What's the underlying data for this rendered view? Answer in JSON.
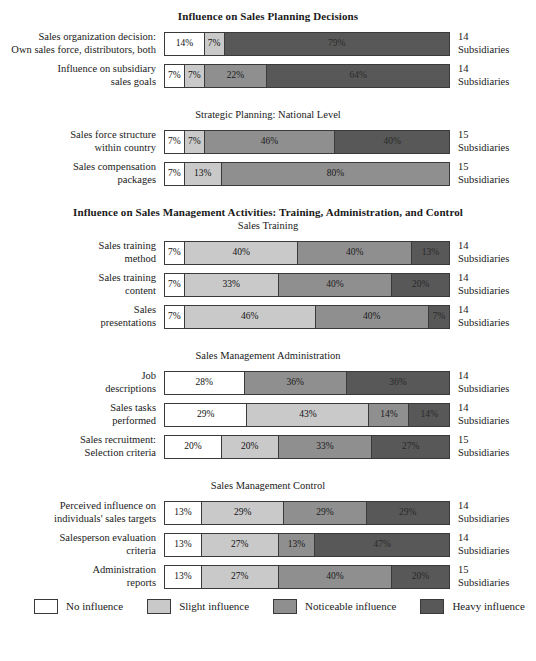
{
  "chart_data": {
    "type": "bar",
    "subtype": "stacked-horizontal-percentage",
    "title": "Influence on Sales Planning Decisions",
    "xlabel": "",
    "ylabel": "",
    "xlim": [
      0,
      100
    ],
    "grid": false,
    "legend_position": "bottom",
    "legend": [
      {
        "key": "lvl0",
        "label": "No influence",
        "color": "#ffffff"
      },
      {
        "key": "lvl1",
        "label": "Slight influence",
        "color": "#c9c9c9"
      },
      {
        "key": "lvl2",
        "label": "Noticeable influence",
        "color": "#8f8f8f"
      },
      {
        "key": "lvl3",
        "label": "Heavy influence",
        "color": "#585858"
      }
    ],
    "series": [
      {
        "name": "No influence",
        "values": [
          14,
          7,
          7,
          7,
          7,
          7,
          7,
          28,
          29,
          20,
          13,
          13,
          13
        ]
      },
      {
        "name": "Slight influence",
        "values": [
          7,
          7,
          7,
          13,
          40,
          33,
          46,
          0,
          43,
          20,
          29,
          27,
          27
        ]
      },
      {
        "name": "Noticeable influence",
        "values": [
          0,
          22,
          46,
          80,
          40,
          40,
          40,
          36,
          14,
          33,
          29,
          13,
          40
        ]
      },
      {
        "name": "Heavy influence",
        "values": [
          79,
          64,
          40,
          0,
          13,
          20,
          7,
          36,
          14,
          27,
          29,
          47,
          20
        ]
      }
    ],
    "categories": [
      "Sales organization decision: Own sales force, distributors, both",
      "Influence on subsidiary sales goals",
      "Sales force structure within country",
      "Sales compensation packages",
      "Sales training method",
      "Sales training content",
      "Sales presentations",
      "Job descriptions",
      "Sales tasks performed",
      "Sales recruitment: Selection criteria",
      "Perceived influence on individuals' sales targets",
      "Salesperson evaluation criteria",
      "Administration reports"
    ]
  },
  "sections": [
    {
      "title": "Influence on Sales Planning Decisions",
      "title_style": "bold",
      "subtitle": "",
      "rows": [
        {
          "label_lines": [
            "Sales organization decision:",
            "Own sales force, distributors, both"
          ],
          "segments": [
            {
              "level": "lvl0",
              "value": 14,
              "text": "14%"
            },
            {
              "level": "lvl1",
              "value": 7,
              "text": "7%"
            },
            {
              "level": "lvl3",
              "value": 79,
              "text": "79%"
            }
          ],
          "note_number": "14",
          "note_word": "Subsidiaries"
        },
        {
          "label_lines": [
            "Influence on subsidiary",
            "sales goals"
          ],
          "segments": [
            {
              "level": "lvl0",
              "value": 7,
              "text": "7%"
            },
            {
              "level": "lvl1",
              "value": 7,
              "text": "7%"
            },
            {
              "level": "lvl2",
              "value": 22,
              "text": "22%"
            },
            {
              "level": "lvl3",
              "value": 64,
              "text": "64%"
            }
          ],
          "note_number": "14",
          "note_word": "Subsidiaries"
        }
      ]
    },
    {
      "title": "",
      "title_style": "plain",
      "subtitle": "Strategic Planning: National Level",
      "rows": [
        {
          "label_lines": [
            "Sales force structure",
            "within country"
          ],
          "segments": [
            {
              "level": "lvl0",
              "value": 7,
              "text": "7%"
            },
            {
              "level": "lvl1",
              "value": 7,
              "text": "7%"
            },
            {
              "level": "lvl2",
              "value": 46,
              "text": "46%"
            },
            {
              "level": "lvl3",
              "value": 40,
              "text": "40%"
            }
          ],
          "note_number": "15",
          "note_word": "Subsidiaries"
        },
        {
          "label_lines": [
            "Sales compensation",
            "packages"
          ],
          "segments": [
            {
              "level": "lvl0",
              "value": 7,
              "text": "7%"
            },
            {
              "level": "lvl1",
              "value": 13,
              "text": "13%"
            },
            {
              "level": "lvl2",
              "value": 80,
              "text": "80%"
            }
          ],
          "note_number": "15",
          "note_word": "Subsidiaries"
        }
      ]
    },
    {
      "title": "Influence on Sales Management Activities: Training, Administration, and Control",
      "title_style": "bold",
      "subtitle": "Sales Training",
      "rows": [
        {
          "label_lines": [
            "Sales training",
            "method"
          ],
          "segments": [
            {
              "level": "lvl0",
              "value": 7,
              "text": "7%"
            },
            {
              "level": "lvl1",
              "value": 40,
              "text": "40%"
            },
            {
              "level": "lvl2",
              "value": 40,
              "text": "40%"
            },
            {
              "level": "lvl3",
              "value": 13,
              "text": "13%"
            }
          ],
          "note_number": "14",
          "note_word": "Subsidiaries"
        },
        {
          "label_lines": [
            "Sales training",
            "content"
          ],
          "segments": [
            {
              "level": "lvl0",
              "value": 7,
              "text": "7%"
            },
            {
              "level": "lvl1",
              "value": 33,
              "text": "33%"
            },
            {
              "level": "lvl2",
              "value": 40,
              "text": "40%"
            },
            {
              "level": "lvl3",
              "value": 20,
              "text": "20%"
            }
          ],
          "note_number": "14",
          "note_word": "Subsidiaries"
        },
        {
          "label_lines": [
            "Sales",
            "presentations"
          ],
          "segments": [
            {
              "level": "lvl0",
              "value": 7,
              "text": "7%"
            },
            {
              "level": "lvl1",
              "value": 46,
              "text": "46%"
            },
            {
              "level": "lvl2",
              "value": 40,
              "text": "40%"
            },
            {
              "level": "lvl3",
              "value": 7,
              "text": "7%"
            }
          ],
          "note_number": "14",
          "note_word": "Subsidiaries"
        }
      ]
    },
    {
      "title": "",
      "title_style": "plain",
      "subtitle": "Sales Management Administration",
      "rows": [
        {
          "label_lines": [
            "Job",
            "descriptions"
          ],
          "segments": [
            {
              "level": "lvl0",
              "value": 28,
              "text": "28%"
            },
            {
              "level": "lvl2",
              "value": 36,
              "text": "36%"
            },
            {
              "level": "lvl3",
              "value": 36,
              "text": "36%"
            }
          ],
          "note_number": "14",
          "note_word": "Subsidiaries"
        },
        {
          "label_lines": [
            "Sales tasks",
            "performed"
          ],
          "segments": [
            {
              "level": "lvl0",
              "value": 29,
              "text": "29%"
            },
            {
              "level": "lvl1",
              "value": 43,
              "text": "43%"
            },
            {
              "level": "lvl2",
              "value": 14,
              "text": "14%"
            },
            {
              "level": "lvl3",
              "value": 14,
              "text": "14%"
            }
          ],
          "note_number": "14",
          "note_word": "Subsidiaries"
        },
        {
          "label_lines": [
            "Sales recruitment:",
            "Selection criteria"
          ],
          "segments": [
            {
              "level": "lvl0",
              "value": 20,
              "text": "20%"
            },
            {
              "level": "lvl1",
              "value": 20,
              "text": "20%"
            },
            {
              "level": "lvl2",
              "value": 33,
              "text": "33%"
            },
            {
              "level": "lvl3",
              "value": 27,
              "text": "27%"
            }
          ],
          "note_number": "15",
          "note_word": "Subsidiaries"
        }
      ]
    },
    {
      "title": "",
      "title_style": "plain",
      "subtitle": "Sales Management Control",
      "rows": [
        {
          "label_lines": [
            "Perceived influence on",
            "individuals' sales targets"
          ],
          "segments": [
            {
              "level": "lvl0",
              "value": 13,
              "text": "13%"
            },
            {
              "level": "lvl1",
              "value": 29,
              "text": "29%"
            },
            {
              "level": "lvl2",
              "value": 29,
              "text": "29%"
            },
            {
              "level": "lvl3",
              "value": 29,
              "text": "29%"
            }
          ],
          "note_number": "14",
          "note_word": "Subsidiaries"
        },
        {
          "label_lines": [
            "Salesperson evaluation",
            "criteria"
          ],
          "segments": [
            {
              "level": "lvl0",
              "value": 13,
              "text": "13%"
            },
            {
              "level": "lvl1",
              "value": 27,
              "text": "27%"
            },
            {
              "level": "lvl2",
              "value": 13,
              "text": "13%"
            },
            {
              "level": "lvl3",
              "value": 47,
              "text": "47%"
            }
          ],
          "note_number": "14",
          "note_word": "Subsidiaries"
        },
        {
          "label_lines": [
            "Administration",
            "reports"
          ],
          "segments": [
            {
              "level": "lvl0",
              "value": 13,
              "text": "13%"
            },
            {
              "level": "lvl1",
              "value": 27,
              "text": "27%"
            },
            {
              "level": "lvl2",
              "value": 40,
              "text": "40%"
            },
            {
              "level": "lvl3",
              "value": 20,
              "text": "20%"
            }
          ],
          "note_number": "15",
          "note_word": "Subsidiaries"
        }
      ]
    }
  ],
  "legend": {
    "items": [
      {
        "level": "lvl0",
        "label": "No influence"
      },
      {
        "level": "lvl1",
        "label": "Slight influence"
      },
      {
        "level": "lvl2",
        "label": "Noticeable influence"
      },
      {
        "level": "lvl3",
        "label": "Heavy influence"
      }
    ]
  },
  "caption": ""
}
